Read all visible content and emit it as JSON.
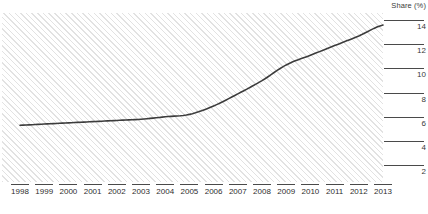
{
  "chart_data": {
    "type": "line",
    "title": "",
    "xlabel": "",
    "ylabel": "Share (%)",
    "ylim": [
      1,
      15
    ],
    "xlim": [
      1997.5,
      2013.9
    ],
    "grid": false,
    "legend": "none",
    "y_ticks": [
      14,
      12,
      10,
      8,
      6,
      4,
      2
    ],
    "categories": [
      "1998",
      "1999",
      "2000",
      "2001",
      "2002",
      "2003",
      "2004",
      "2005",
      "2006",
      "2007",
      "2008",
      "2009",
      "2010",
      "2011",
      "2012",
      "2013"
    ],
    "series": [
      {
        "name": "Share (%)",
        "color": "#3c3c3c",
        "values": [
          5.7,
          5.8,
          5.9,
          6.0,
          6.1,
          6.2,
          6.4,
          6.6,
          7.3,
          8.3,
          9.4,
          10.7,
          11.5,
          12.3,
          13.1,
          14.0
        ]
      }
    ],
    "annotations": []
  },
  "axis": {
    "y_title": "Share (%)",
    "y_labels": [
      "14",
      "12",
      "10",
      "8",
      "6",
      "4",
      "2"
    ],
    "x_labels": [
      "1998",
      "1999",
      "2000",
      "2001",
      "2002",
      "2003",
      "2004",
      "2005",
      "2006",
      "2007",
      "2008",
      "2009",
      "2010",
      "2011",
      "2012",
      "2013"
    ]
  },
  "caption": {
    "text": ""
  },
  "colors": {
    "line": "#3c3c3c",
    "hatch": "#e2e2e2",
    "axis": "#4a4a4a",
    "text": "#2e2e2e",
    "background": "#ffffff"
  }
}
